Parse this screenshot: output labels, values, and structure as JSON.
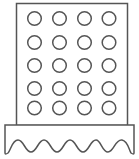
{
  "figure": {
    "grid": {
      "columns": 4,
      "rows": 5
    },
    "colors": {
      "stroke": "#555555",
      "fill": "#ffffff",
      "background": "#ffffff"
    }
  }
}
